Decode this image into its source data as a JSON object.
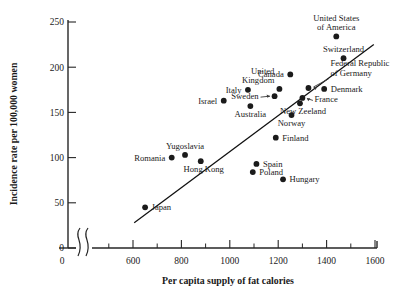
{
  "chart_data": {
    "type": "scatter",
    "title": "",
    "xlabel": "Per capita supply of fat calories",
    "ylabel": "Incidence rate per 100,000 women",
    "xlim": [
      480,
      1620
    ],
    "ylim": [
      0,
      262
    ],
    "x_ticks": [
      600,
      800,
      1000,
      1200,
      1400,
      1600
    ],
    "x_tick_labels": [
      "600",
      "800",
      "1000",
      "1200",
      "1400",
      "1600"
    ],
    "x_minor_ticks": [
      500,
      700,
      900,
      1100,
      1300,
      1500
    ],
    "x_origin_label": "0",
    "axis_break": true,
    "y_ticks": [
      0,
      50,
      100,
      150,
      200,
      250
    ],
    "y_tick_labels": [
      "0",
      "50",
      "100",
      "150",
      "200",
      "250"
    ],
    "grid": false,
    "legend": "none",
    "points": [
      {
        "label": "Japan",
        "x": 650,
        "y": 45,
        "label_pos": "right"
      },
      {
        "label": "Romania",
        "x": 760,
        "y": 100,
        "label_pos": "left"
      },
      {
        "label": "Yugoslavia",
        "x": 815,
        "y": 103,
        "label_pos": "above"
      },
      {
        "label": "Hong Kong",
        "x": 880,
        "y": 96,
        "label_pos": "below-right"
      },
      {
        "label": "Israel",
        "x": 975,
        "y": 163,
        "label_pos": "left"
      },
      {
        "label": "Italy",
        "x": 1075,
        "y": 175,
        "label_pos": "left"
      },
      {
        "label": "Australia",
        "x": 1085,
        "y": 157,
        "label_pos": "below"
      },
      {
        "label": "Poland",
        "x": 1095,
        "y": 84,
        "label_pos": "right"
      },
      {
        "label": "Spain",
        "x": 1110,
        "y": 93,
        "label_pos": "right"
      },
      {
        "label": "Sweden",
        "x": 1185,
        "y": 168,
        "label_pos": "left-arrow"
      },
      {
        "label": "Finland",
        "x": 1190,
        "y": 122,
        "label_pos": "right"
      },
      {
        "label": "United Kingdom",
        "x": 1205,
        "y": 176,
        "label_pos": "above-left"
      },
      {
        "label": "Hungary",
        "x": 1220,
        "y": 76,
        "label_pos": "right"
      },
      {
        "label": "Canada",
        "x": 1250,
        "y": 192,
        "label_pos": "left"
      },
      {
        "label": "Norway",
        "x": 1255,
        "y": 147,
        "label_pos": "below"
      },
      {
        "label": "New Zeeland",
        "x": 1290,
        "y": 160,
        "label_pos": "below-right"
      },
      {
        "label": "France",
        "x": 1300,
        "y": 166,
        "label_pos": "right-arrow"
      },
      {
        "label": "Federal Republic of Germany",
        "x": 1325,
        "y": 177,
        "label_pos": "above-right-arrow"
      },
      {
        "label": "Denmark",
        "x": 1390,
        "y": 176,
        "label_pos": "right"
      },
      {
        "label": "Switzerland",
        "x": 1470,
        "y": 210,
        "label_pos": "above"
      },
      {
        "label": "United States of America",
        "x": 1440,
        "y": 234,
        "label_pos": "above"
      }
    ],
    "trend_line": {
      "x1": 605,
      "y1": 28,
      "x2": 1595,
      "y2": 225,
      "description": "fitted regression line"
    }
  }
}
